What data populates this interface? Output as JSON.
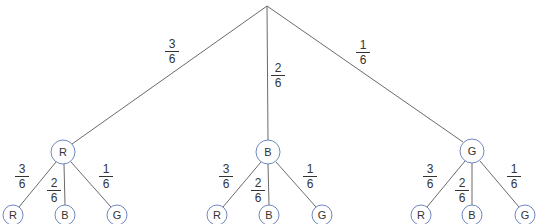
{
  "diagram": {
    "type": "probability-tree",
    "colors": {
      "edge": "#6b6b6b",
      "node_stroke": "#6f86c0",
      "text": "#333333"
    },
    "root": {
      "x": 267,
      "y": 6
    },
    "level1": [
      {
        "label": "R",
        "x": 63,
        "y": 152,
        "prob": {
          "num": "3",
          "den": "6"
        },
        "children": [
          {
            "label": "R",
            "x": 13,
            "y": 215,
            "prob": {
              "num": "3",
              "den": "6"
            }
          },
          {
            "label": "B",
            "x": 65,
            "y": 215,
            "prob": {
              "num": "2",
              "den": "6"
            }
          },
          {
            "label": "G",
            "x": 117,
            "y": 215,
            "prob": {
              "num": "1",
              "den": "6"
            }
          }
        ]
      },
      {
        "label": "B",
        "x": 268,
        "y": 152,
        "prob": {
          "num": "2",
          "den": "6"
        },
        "children": [
          {
            "label": "R",
            "x": 217,
            "y": 215,
            "prob": {
              "num": "3",
              "den": "6"
            }
          },
          {
            "label": "B",
            "x": 269,
            "y": 215,
            "prob": {
              "num": "2",
              "den": "6"
            }
          },
          {
            "label": "G",
            "x": 322,
            "y": 215,
            "prob": {
              "num": "1",
              "den": "6"
            }
          }
        ]
      },
      {
        "label": "G",
        "x": 472,
        "y": 151,
        "prob": {
          "num": "1",
          "den": "6"
        },
        "children": [
          {
            "label": "R",
            "x": 421,
            "y": 215,
            "prob": {
              "num": "3",
              "den": "6"
            }
          },
          {
            "label": "B",
            "x": 472,
            "y": 215,
            "prob": {
              "num": "2",
              "den": "6"
            }
          },
          {
            "label": "G",
            "x": 525,
            "y": 215,
            "prob": {
              "num": "1",
              "den": "6"
            }
          }
        ]
      }
    ]
  },
  "labels": {
    "top": [
      {
        "num": "3",
        "den": "6",
        "x": 165,
        "y": 38
      },
      {
        "num": "2",
        "den": "6",
        "x": 271,
        "y": 62
      },
      {
        "num": "1",
        "den": "6",
        "x": 356,
        "y": 39
      }
    ],
    "sub": [
      {
        "num": "3",
        "den": "6",
        "x": 15,
        "y": 163
      },
      {
        "num": "2",
        "den": "6",
        "x": 47,
        "y": 177
      },
      {
        "num": "1",
        "den": "6",
        "x": 99,
        "y": 163
      },
      {
        "num": "3",
        "den": "6",
        "x": 219,
        "y": 163
      },
      {
        "num": "2",
        "den": "6",
        "x": 251,
        "y": 177
      },
      {
        "num": "1",
        "den": "6",
        "x": 303,
        "y": 163
      },
      {
        "num": "3",
        "den": "6",
        "x": 423,
        "y": 163
      },
      {
        "num": "2",
        "den": "6",
        "x": 455,
        "y": 177
      },
      {
        "num": "1",
        "den": "6",
        "x": 507,
        "y": 163
      }
    ]
  }
}
